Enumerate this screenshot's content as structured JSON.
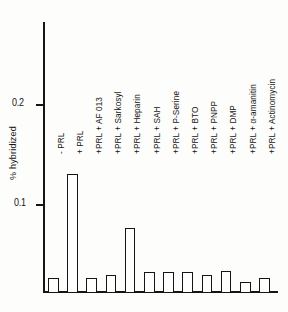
{
  "chart_data": {
    "type": "bar",
    "title": "",
    "subtitle": "",
    "xlabel": "",
    "ylabel": "% hybridized",
    "ylim": [
      0,
      0.29
    ],
    "grid": false,
    "legend": "none",
    "y_ticks": [
      "0.1",
      "0.2"
    ],
    "y_tick_values": [
      0.1,
      0.2
    ],
    "categories": [
      "- PRL",
      "+ PRL",
      "+PRL + AF 013",
      "+PRL + Sarkosyl",
      "+PRL + Heparin",
      "+PRL + SAH",
      "+PRL + P-Serine",
      "+PRL + BTO",
      "+PRL + PNPP",
      "+PRL + DMP",
      "+PRL + α-amanitin",
      "+PRL +  Actinomycin"
    ],
    "values": [
      0.016,
      0.136,
      0.016,
      0.019,
      0.073,
      0.023,
      0.023,
      0.023,
      0.02,
      0.024,
      0.012,
      0.016
    ],
    "bar_fill": "#ffffff",
    "bar_stroke": "#151515",
    "axis_color": "#151515"
  },
  "axis": {
    "y_title": "% hybridized",
    "tick_02": "0.2",
    "tick_01": "0.1"
  }
}
